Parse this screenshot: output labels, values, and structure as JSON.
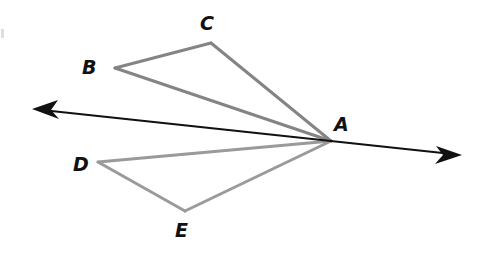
{
  "figure": {
    "kind": "geometry-diagram",
    "width": 488,
    "height": 254,
    "background_color": "#ffffff",
    "colors": {
      "upper_triangle_stroke": "#848484",
      "lower_triangle_stroke": "#9a9a9a",
      "arrow_line_stroke": "#111111",
      "label_text": "#111111"
    },
    "points": [
      {
        "id": "A",
        "label": "A",
        "x": 331,
        "y": 141,
        "label_x": 334,
        "label_y": 115
      },
      {
        "id": "B",
        "label": "B",
        "x": 115,
        "y": 68,
        "label_x": 82,
        "label_y": 58
      },
      {
        "id": "C",
        "label": "C",
        "x": 211,
        "y": 43,
        "label_x": 200,
        "label_y": 14
      },
      {
        "id": "D",
        "label": "D",
        "x": 98,
        "y": 162,
        "label_x": 73,
        "label_y": 155
      },
      {
        "id": "E",
        "label": "E",
        "x": 185,
        "y": 211,
        "label_x": 175,
        "label_y": 221
      }
    ],
    "segments": [
      {
        "id": "BC",
        "from": "B",
        "to": "C",
        "color": "#848484",
        "width": 3
      },
      {
        "id": "CA",
        "from": "C",
        "to": "A",
        "color": "#848484",
        "width": 3
      },
      {
        "id": "BA",
        "from": "B",
        "to": "A",
        "color": "#848484",
        "width": 3
      },
      {
        "id": "DE",
        "from": "D",
        "to": "E",
        "color": "#9a9a9a",
        "width": 3
      },
      {
        "id": "EA",
        "from": "E",
        "to": "A",
        "color": "#9a9a9a",
        "width": 3
      },
      {
        "id": "DA",
        "from": "D",
        "to": "A",
        "color": "#9a9a9a",
        "width": 3
      }
    ],
    "arrow_line": {
      "id": "line-through-A",
      "start_x": 32,
      "start_y": 109,
      "end_x": 462,
      "end_y": 155,
      "color": "#111111",
      "width": 2,
      "double_headed": true
    }
  }
}
